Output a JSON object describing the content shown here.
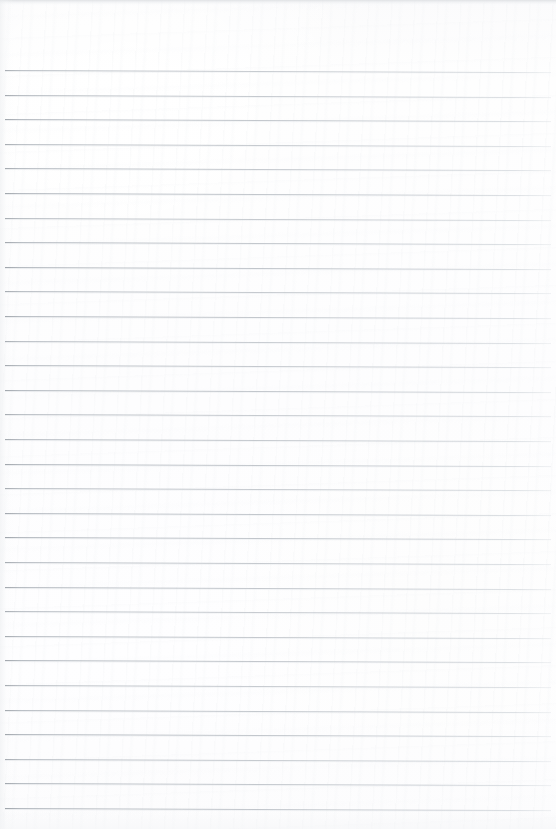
{
  "document": {
    "type": "scanned-blank-ruled-paper",
    "title": "Blank lined notebook page",
    "content_text": "",
    "has_handwriting": false,
    "has_printed_text": false
  },
  "page": {
    "width": 556,
    "height": 829,
    "background_color": "#fdfdfe",
    "top_margin_px": 70,
    "bottom_blank_px": 24
  },
  "ruling": {
    "style": "horizontal-ruled",
    "line_color": "#b9bdc2",
    "line_thickness_px": 1,
    "line_spacing_px": 24.6,
    "line_count": 31,
    "first_line_y": 70,
    "last_line_y": 805,
    "left_inset_px": 5,
    "right_inset_px": 5,
    "skew_deg": 0.22,
    "vertical_margin_rule": false
  },
  "scan_artifacts": {
    "top_edge_band_color": "#dddfe2",
    "top_edge_band_height_px": 6,
    "left_gutter_shadow": true,
    "bottom_edge_fade": true
  }
}
